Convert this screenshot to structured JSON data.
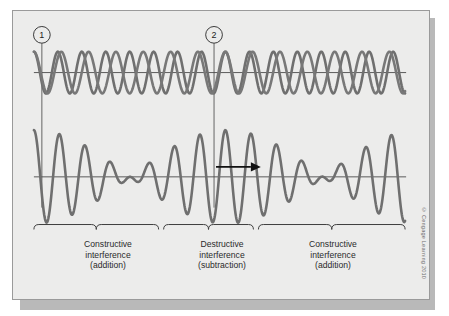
{
  "figure": {
    "markers": [
      {
        "label": "1",
        "x": 41
      },
      {
        "label": "2",
        "x": 214
      }
    ],
    "direction_arrow": {
      "name": "wave-direction-arrow",
      "points": "right"
    },
    "captions": [
      {
        "line1": "Constructive",
        "line2": "interference",
        "line3": "(addition)"
      },
      {
        "line1": "Destructive",
        "line2": "interference",
        "line3": "(subtraction)"
      },
      {
        "line1": "Constructive",
        "line2": "interference",
        "line3": "(addition)"
      }
    ],
    "credit": "© Cengage Learning 2010",
    "colors": {
      "panel_background": "#ececeb",
      "panel_border": "#9a9a9a",
      "wave_stroke": "#6f6f6f",
      "axis_stroke": "#4a4a4a",
      "brace_stroke": "#3c3c3c",
      "text": "#2a2a2a"
    },
    "show_through_text": [
      "Wavelength",
      "interference",
      "wave"
    ]
  },
  "chart_data": {
    "type": "line",
    "xlabel": "",
    "ylabel": "",
    "grid": false,
    "legend": null,
    "panels": [
      {
        "name": "component-waves",
        "axis_y": 72,
        "description": "Two sinusoidal component waves of slightly different wavelength drawn superimposed; in phase at marker 1, fully out of phase at marker 2.",
        "series": [
          {
            "name": "wave-a",
            "wavelength_px": 24.0,
            "amplitude_px": 21,
            "phase_deg": 0
          },
          {
            "name": "wave-b",
            "wavelength_px": 27.4,
            "amplitude_px": 21,
            "phase_deg": 0
          }
        ],
        "x_range": [
          33,
          405
        ]
      },
      {
        "name": "resultant-wave",
        "axis_y": 177,
        "description": "Resultant beat wave: envelope maximum (constructive) at left and right, node (destructive) near marker 2.",
        "series": [
          {
            "name": "resultant",
            "carrier_wavelength_px": 25.6,
            "envelope_wavelength_px": 193,
            "max_amplitude_px": 47,
            "node_x": 214
          }
        ],
        "x_range": [
          33,
          405
        ]
      }
    ],
    "regions": [
      {
        "label": "Constructive interference (addition)",
        "x_start": 33,
        "x_end": 158
      },
      {
        "label": "Destructive interference (subtraction)",
        "x_start": 163,
        "x_end": 253
      },
      {
        "label": "Constructive interference (addition)",
        "x_start": 258,
        "x_end": 405
      }
    ]
  }
}
